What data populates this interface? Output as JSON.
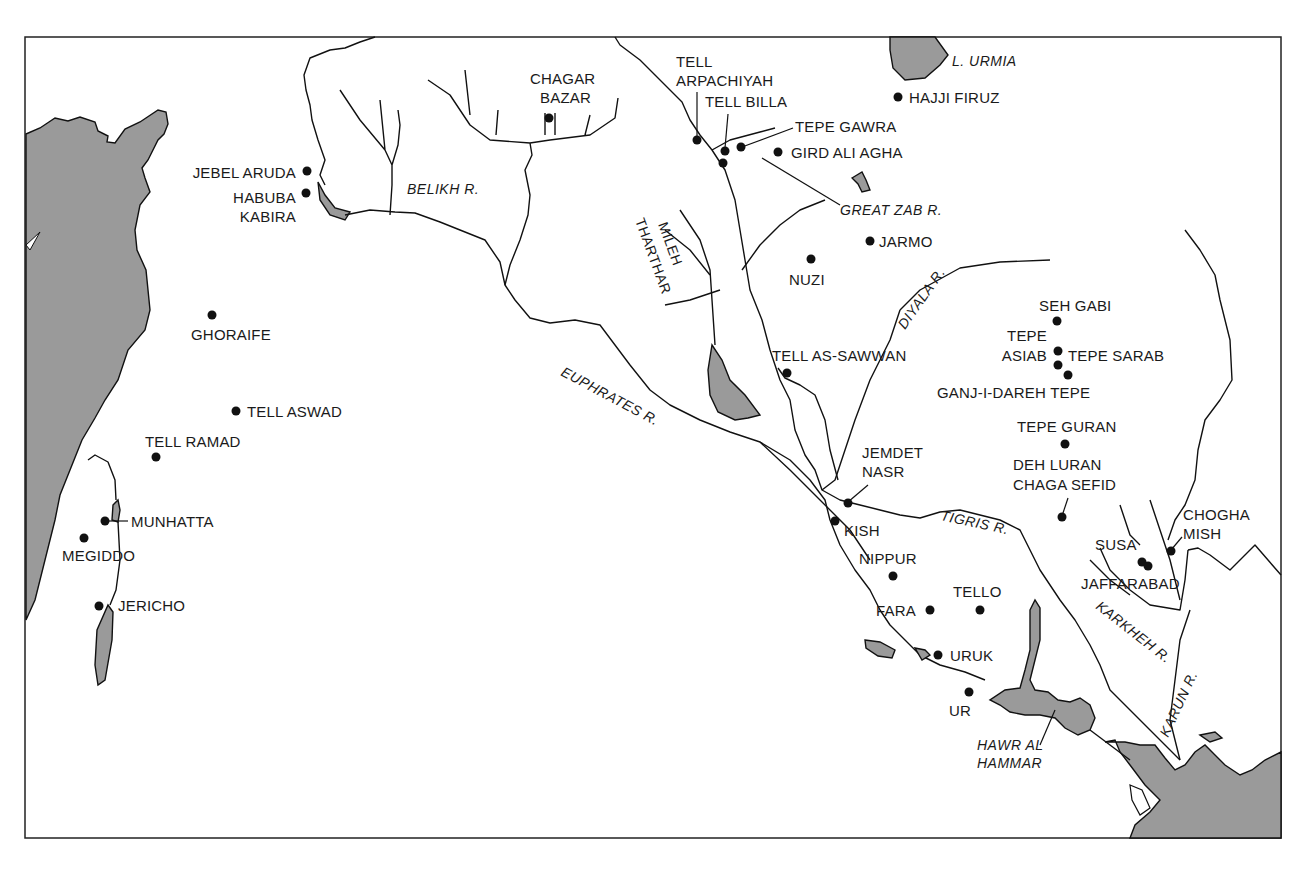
{
  "map": {
    "water_labels": {
      "lake_urmia": "L. URMIA",
      "hawr_al_hammar_1": "HAWR AL",
      "hawr_al_hammar_2": "HAMMAR"
    },
    "river_labels": {
      "belikh": "BELIKH R.",
      "great_zab": "GREAT ZAB R.",
      "euphrates": "EUPHRATES R.",
      "tigris": "TIGRIS R.",
      "diyala": "DIYALA R.",
      "karkheh": "KARKHEH R.",
      "karun": "KARUN R.",
      "mileh_tharthar_1": "MILEH",
      "mileh_tharthar_2": "THARTHAR"
    },
    "sites": [
      {
        "name": "JEBEL ARUDA",
        "lines": [
          "JEBEL ARUDA"
        ]
      },
      {
        "name": "HABUBA KABIRA",
        "lines": [
          "HABUBA",
          "KABIRA"
        ]
      },
      {
        "name": "CHAGAR BAZAR",
        "lines": [
          "CHAGAR",
          "BAZAR"
        ]
      },
      {
        "name": "TELL ARPACHIYAH",
        "lines": [
          "TELL",
          "ARPACHIYAH"
        ]
      },
      {
        "name": "TELL BILLA",
        "lines": [
          "TELL BILLA"
        ]
      },
      {
        "name": "TEPE GAWRA",
        "lines": [
          "TEPE GAWRA"
        ]
      },
      {
        "name": "GIRD ALI AGHA",
        "lines": [
          "GIRD ALI AGHA"
        ]
      },
      {
        "name": "HAJJI FIRUZ",
        "lines": [
          "HAJJI FIRUZ"
        ]
      },
      {
        "name": "JARMO",
        "lines": [
          "JARMO"
        ]
      },
      {
        "name": "NUZI",
        "lines": [
          "NUZI"
        ]
      },
      {
        "name": "GHORAIFE",
        "lines": [
          "GHORAIFE"
        ]
      },
      {
        "name": "TELL ASWAD",
        "lines": [
          "TELL ASWAD"
        ]
      },
      {
        "name": "TELL RAMAD",
        "lines": [
          "TELL RAMAD"
        ]
      },
      {
        "name": "MUNHATTA",
        "lines": [
          "MUNHATTA"
        ]
      },
      {
        "name": "MEGIDDO",
        "lines": [
          "MEGIDDO"
        ]
      },
      {
        "name": "JERICHO",
        "lines": [
          "JERICHO"
        ]
      },
      {
        "name": "TELL AS-SAWWAN",
        "lines": [
          "TELL AS-SAWWAN"
        ]
      },
      {
        "name": "SEH GABI",
        "lines": [
          "SEH GABI"
        ]
      },
      {
        "name": "TEPE ASIAB",
        "lines": [
          "TEPE",
          "ASIAB"
        ]
      },
      {
        "name": "TEPE SARAB",
        "lines": [
          "TEPE SARAB"
        ]
      },
      {
        "name": "GANJ-I-DAREH TEPE",
        "lines": [
          "GANJ-I-DAREH TEPE"
        ]
      },
      {
        "name": "TEPE GURAN",
        "lines": [
          "TEPE GURAN"
        ]
      },
      {
        "name": "DEH LURAN CHAGA SEFID",
        "lines": [
          "DEH LURAN",
          "CHAGA SEFID"
        ]
      },
      {
        "name": "JEMDET NASR",
        "lines": [
          "JEMDET",
          "NASR"
        ]
      },
      {
        "name": "KISH",
        "lines": [
          "KISH"
        ]
      },
      {
        "name": "NIPPUR",
        "lines": [
          "NIPPUR"
        ]
      },
      {
        "name": "TELLO",
        "lines": [
          "TELLO"
        ]
      },
      {
        "name": "FARA",
        "lines": [
          "FARA"
        ]
      },
      {
        "name": "URUK",
        "lines": [
          "URUK"
        ]
      },
      {
        "name": "UR",
        "lines": [
          "UR"
        ]
      },
      {
        "name": "SUSA",
        "lines": [
          "SUSA"
        ]
      },
      {
        "name": "JAFFARABAD",
        "lines": [
          "JAFFARABAD"
        ]
      },
      {
        "name": "CHOGHA MISH",
        "lines": [
          "CHOGHA",
          "MISH"
        ]
      }
    ]
  }
}
